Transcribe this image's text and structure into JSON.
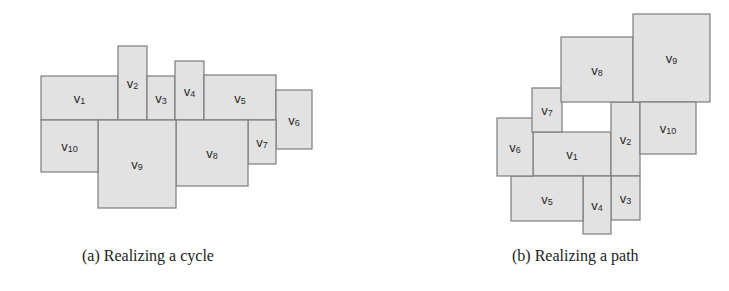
{
  "colors": {
    "fill": "#e2e2e2",
    "stroke": "#7d7d7d",
    "text": "#2a2a2a"
  },
  "figures": [
    {
      "id": "a",
      "caption": "(a) Realizing a cycle",
      "rectangles": [
        {
          "label": "v",
          "sub": "1",
          "x": 41,
          "y": 76,
          "w": 77,
          "h": 44
        },
        {
          "label": "v",
          "sub": "2",
          "x": 118,
          "y": 46,
          "w": 29,
          "h": 74
        },
        {
          "label": "v",
          "sub": "3",
          "x": 147,
          "y": 76,
          "w": 28,
          "h": 44
        },
        {
          "label": "v",
          "sub": "4",
          "x": 175,
          "y": 61,
          "w": 29,
          "h": 59
        },
        {
          "label": "v",
          "sub": "5",
          "x": 204,
          "y": 75,
          "w": 72,
          "h": 45
        },
        {
          "label": "v",
          "sub": "6",
          "x": 276,
          "y": 90,
          "w": 36,
          "h": 59
        },
        {
          "label": "v",
          "sub": "7",
          "x": 248,
          "y": 120,
          "w": 28,
          "h": 44
        },
        {
          "label": "v",
          "sub": "8",
          "x": 176,
          "y": 120,
          "w": 72,
          "h": 66
        },
        {
          "label": "v",
          "sub": "9",
          "x": 98,
          "y": 120,
          "w": 78,
          "h": 88
        },
        {
          "label": "v",
          "sub": "10",
          "x": 41,
          "y": 120,
          "w": 57,
          "h": 52
        }
      ]
    },
    {
      "id": "b",
      "caption": "(b) Realizing a path",
      "rectangles": [
        {
          "label": "v",
          "sub": "1",
          "x": 533,
          "y": 132,
          "w": 78,
          "h": 44
        },
        {
          "label": "v",
          "sub": "2",
          "x": 611,
          "y": 102,
          "w": 29,
          "h": 74
        },
        {
          "label": "v",
          "sub": "3",
          "x": 611,
          "y": 176,
          "w": 29,
          "h": 44
        },
        {
          "label": "v",
          "sub": "4",
          "x": 583,
          "y": 176,
          "w": 28,
          "h": 58
        },
        {
          "label": "v",
          "sub": "5",
          "x": 511,
          "y": 176,
          "w": 72,
          "h": 45
        },
        {
          "label": "v",
          "sub": "6",
          "x": 497,
          "y": 118,
          "w": 36,
          "h": 58
        },
        {
          "label": "v",
          "sub": "7",
          "x": 532,
          "y": 88,
          "w": 30,
          "h": 44
        },
        {
          "label": "v",
          "sub": "8",
          "x": 561,
          "y": 37,
          "w": 72,
          "h": 65
        },
        {
          "label": "v",
          "sub": "9",
          "x": 633,
          "y": 14,
          "w": 77,
          "h": 88
        },
        {
          "label": "v",
          "sub": "10",
          "x": 640,
          "y": 102,
          "w": 56,
          "h": 52
        }
      ]
    }
  ]
}
